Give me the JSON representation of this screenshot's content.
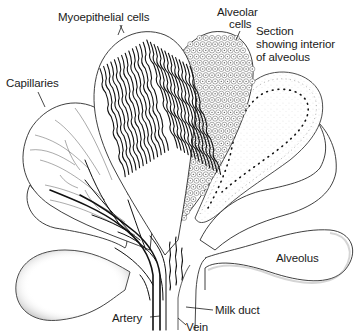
{
  "diagram": {
    "labels": {
      "myoepithelial_cells": "Myoepithelial cells",
      "alveolar_cells_line1": "Alveolar",
      "alveolar_cells_line2": "cells",
      "section_line1": "Section",
      "section_line2": "showing interior",
      "section_line3": "of alveolus",
      "capillaries": "Capillaries",
      "alveolus": "Alveolus",
      "artery": "Artery",
      "vein": "Vein",
      "milk_duct": "Milk duct"
    },
    "colors": {
      "ink": "#1a1a1a",
      "background": "#ffffff"
    }
  }
}
